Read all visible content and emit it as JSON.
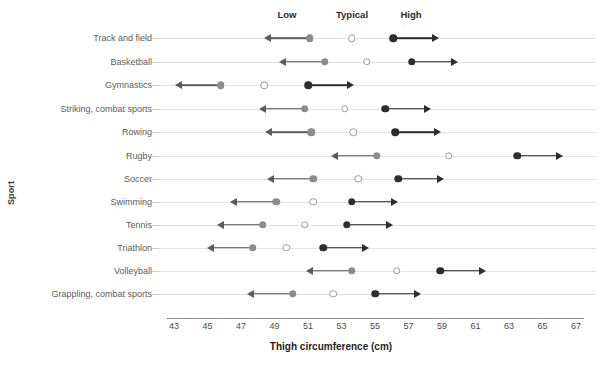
{
  "chart_data": {
    "type": "scatter",
    "title": "",
    "xlabel": "Thigh circumference (cm)",
    "ylabel": "Sport",
    "xlim": [
      43,
      67
    ],
    "xticks": [
      43,
      45,
      47,
      49,
      51,
      53,
      55,
      57,
      59,
      61,
      63,
      65,
      67
    ],
    "grid": true,
    "legend_position": "top",
    "column_headers": [
      "Low",
      "Typical",
      "High"
    ],
    "series": [
      {
        "name": "Low",
        "marker": "filled-gray-circle-with-left-arrow",
        "color": "#8c8c8c"
      },
      {
        "name": "Typical",
        "marker": "open-circle",
        "color": "#ffffff"
      },
      {
        "name": "High",
        "marker": "filled-black-circle-with-right-arrow",
        "color": "#2d2d2d"
      }
    ],
    "categories": [
      "Track and field",
      "Basketball",
      "Gymnastics",
      "Striking, combat sports",
      "Rowing",
      "Rugby",
      "Soccer",
      "Swimming",
      "Tennis",
      "Triathlon",
      "Volleyball",
      "Grappling, combat sports"
    ],
    "rows": [
      {
        "sport": "Track and field",
        "low": 51.1,
        "typical": 53.6,
        "high": 56.1
      },
      {
        "sport": "Basketball",
        "low": 52.0,
        "typical": 54.5,
        "high": 57.2
      },
      {
        "sport": "Gymnastics",
        "low": 45.8,
        "typical": 48.4,
        "high": 51.0
      },
      {
        "sport": "Striking, combat sports",
        "low": 50.8,
        "typical": 53.2,
        "high": 55.6
      },
      {
        "sport": "Rowing",
        "low": 51.2,
        "typical": 53.7,
        "high": 56.2
      },
      {
        "sport": "Rugby",
        "low": 55.1,
        "typical": 59.4,
        "high": 63.5
      },
      {
        "sport": "Soccer",
        "low": 51.3,
        "typical": 54.0,
        "high": 56.4
      },
      {
        "sport": "Swimming",
        "low": 49.1,
        "typical": 51.3,
        "high": 53.6
      },
      {
        "sport": "Tennis",
        "low": 48.3,
        "typical": 50.8,
        "high": 53.3
      },
      {
        "sport": "Triathlon",
        "low": 47.7,
        "typical": 49.7,
        "high": 51.9
      },
      {
        "sport": "Volleyball",
        "low": 53.6,
        "typical": 56.3,
        "high": 58.9
      },
      {
        "sport": "Grappling, combat sports",
        "low": 50.1,
        "typical": 52.5,
        "high": 55.0
      }
    ]
  },
  "colors": {
    "low": "#8c8c8c",
    "typical_fill": "#ffffff",
    "typical_border": "#9a9a9a",
    "high": "#2d2d2d",
    "gridline": "#e3e3e3",
    "axis": "#8e8e8e",
    "label": "#5c5c5c"
  }
}
